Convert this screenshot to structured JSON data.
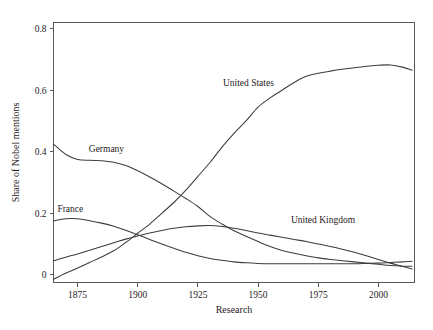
{
  "chart_data": {
    "type": "line",
    "title": "",
    "xlabel": "Research",
    "ylabel": "Share of Nobel mentions",
    "xlim": [
      1865,
      2015
    ],
    "ylim": [
      -0.025,
      0.82
    ],
    "grid": false,
    "legend_position": "inline-labels",
    "xticks": [
      "1875",
      "1900",
      "1925",
      "1950",
      "1975",
      "2000"
    ],
    "xtick_values": [
      1875,
      1900,
      1925,
      1950,
      1975,
      2000
    ],
    "yticks": [
      "0",
      "0.2",
      "0.4",
      "0.6",
      "0.8"
    ],
    "ytick_values": [
      0,
      0.2,
      0.4,
      0.6,
      0.8
    ],
    "x": [
      1865,
      1870,
      1875,
      1880,
      1885,
      1890,
      1895,
      1900,
      1905,
      1910,
      1915,
      1920,
      1925,
      1930,
      1935,
      1940,
      1945,
      1950,
      1955,
      1960,
      1965,
      1970,
      1975,
      1980,
      1985,
      1990,
      1995,
      2000,
      2005,
      2010,
      2014
    ],
    "series": [
      {
        "name": "United States",
        "label": "United States",
        "color": "#3b3d40",
        "values": [
          -0.015,
          0.005,
          0.022,
          0.04,
          0.058,
          0.078,
          0.105,
          0.135,
          0.165,
          0.2,
          0.235,
          0.275,
          0.32,
          0.365,
          0.415,
          0.46,
          0.5,
          0.545,
          0.575,
          0.6,
          0.625,
          0.645,
          0.655,
          0.662,
          0.668,
          0.673,
          0.678,
          0.681,
          0.682,
          0.675,
          0.665
        ]
      },
      {
        "name": "Germany",
        "label": "Germany",
        "color": "#3b3d40",
        "values": [
          0.425,
          0.392,
          0.375,
          0.372,
          0.371,
          0.366,
          0.355,
          0.338,
          0.318,
          0.296,
          0.272,
          0.248,
          0.222,
          0.19,
          0.165,
          0.143,
          0.125,
          0.108,
          0.092,
          0.079,
          0.07,
          0.062,
          0.055,
          0.05,
          0.046,
          0.042,
          0.038,
          0.034,
          0.03,
          0.028,
          0.028
        ]
      },
      {
        "name": "France",
        "label": "France",
        "color": "#3b3d40",
        "values": [
          0.175,
          0.182,
          0.182,
          0.176,
          0.168,
          0.158,
          0.145,
          0.13,
          0.115,
          0.1,
          0.086,
          0.073,
          0.062,
          0.053,
          0.047,
          0.042,
          0.039,
          0.037,
          0.036,
          0.036,
          0.036,
          0.036,
          0.036,
          0.036,
          0.036,
          0.036,
          0.037,
          0.038,
          0.04,
          0.042,
          0.044
        ]
      },
      {
        "name": "United Kingdom",
        "label": "United Kingdom",
        "color": "#3b3d40",
        "values": [
          0.045,
          0.057,
          0.068,
          0.08,
          0.092,
          0.104,
          0.116,
          0.126,
          0.136,
          0.144,
          0.151,
          0.156,
          0.159,
          0.16,
          0.157,
          0.151,
          0.144,
          0.136,
          0.129,
          0.122,
          0.115,
          0.108,
          0.1,
          0.092,
          0.083,
          0.073,
          0.062,
          0.05,
          0.038,
          0.028,
          0.019
        ]
      }
    ],
    "annotations": [
      {
        "text": "United States",
        "x": 1946,
        "y": 0.615
      },
      {
        "text": "Germany",
        "x": 1887,
        "y": 0.398
      },
      {
        "text": "France",
        "x": 1872,
        "y": 0.203
      },
      {
        "text": "United Kingdom",
        "x": 1977,
        "y": 0.168
      }
    ]
  }
}
